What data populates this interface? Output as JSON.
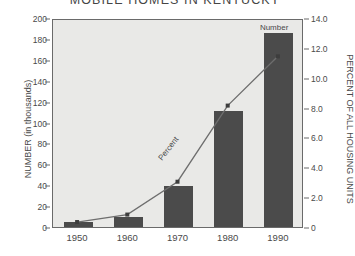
{
  "chart_data": {
    "type": "bar",
    "title": "MOBILE HOMES IN KENTUCKY",
    "categories": [
      "1950",
      "1960",
      "1970",
      "1980",
      "1990"
    ],
    "xlabel": "",
    "grid": false,
    "legend_position": "inline-annotation",
    "series": [
      {
        "name": "Number",
        "type": "bar",
        "axis": "left",
        "unit": "thousands",
        "values": [
          5,
          10,
          39,
          111,
          186
        ]
      },
      {
        "name": "Percent",
        "type": "line",
        "axis": "right",
        "unit": "percent",
        "values": [
          0.4,
          0.9,
          3.1,
          8.2,
          11.5
        ]
      }
    ],
    "axes": {
      "left": {
        "label": "NUMBER (in thousands)",
        "ylim": [
          0,
          200
        ],
        "ticks": [
          0,
          20,
          40,
          60,
          80,
          100,
          120,
          140,
          160,
          180,
          200
        ],
        "tick_labels": [
          "0",
          "20",
          "40",
          "60",
          "80",
          "100",
          "120",
          "140",
          "160",
          "180",
          "200"
        ]
      },
      "right": {
        "label": "PERCENT OF ALL HOUSING UNITS",
        "ylim": [
          0,
          14.0
        ],
        "ticks": [
          0,
          2.0,
          4.0,
          6.0,
          8.0,
          10.0,
          12.0,
          14.0
        ],
        "tick_labels": [
          "0",
          "2.0",
          "4.0",
          "6.0",
          "8.0",
          "10.0",
          "12.0",
          "14.0"
        ]
      }
    },
    "annotations": [
      {
        "name": "number-label",
        "text": "Number"
      },
      {
        "name": "percent-label",
        "text": "Percent"
      }
    ],
    "colors": {
      "bar": "#4b4b4b",
      "line": "#6e6e6e",
      "marker": "#3d3d3d",
      "plot_background": "#e9e9e7",
      "page_background": "#ffffff",
      "axis": "#6a6a6a",
      "text": "#4a4a4a"
    }
  }
}
